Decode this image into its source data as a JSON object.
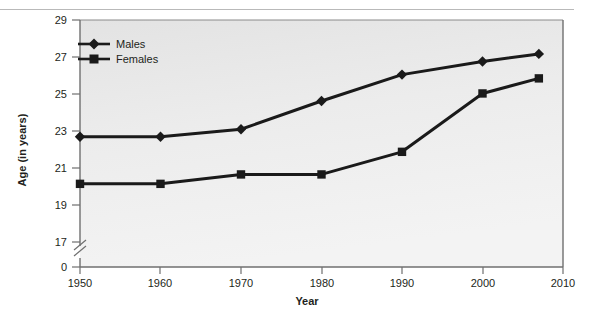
{
  "chart_data": {
    "type": "line",
    "title": "",
    "xlabel": "Year",
    "ylabel": "Age (in years)",
    "x": [
      1950,
      1960,
      1970,
      1980,
      1990,
      2000,
      2007
    ],
    "series": [
      {
        "name": "Males",
        "marker": "diamond",
        "color": "#1a1a1a",
        "values": [
          22.8,
          22.8,
          23.2,
          24.7,
          26.1,
          26.8,
          27.2
        ]
      },
      {
        "name": "Females",
        "marker": "square",
        "color": "#1a1a1a",
        "values": [
          20.3,
          20.3,
          20.8,
          20.8,
          22.0,
          25.1,
          25.9
        ]
      }
    ],
    "x_ticks": [
      "1950",
      "1960",
      "1970",
      "1980",
      "1990",
      "2000",
      "2010"
    ],
    "x_tick_values": [
      1950,
      1960,
      1970,
      1980,
      1990,
      2000,
      2010
    ],
    "xlim": [
      1950,
      2010
    ],
    "y_ticks": [
      "0",
      "17",
      "19",
      "21",
      "23",
      "25",
      "27",
      "29"
    ],
    "y_tick_values": [
      0,
      17,
      19,
      21,
      23,
      25,
      27,
      29
    ],
    "ylim": [
      17,
      29
    ],
    "y_axis_break": true,
    "y_axis_break_label": "axis-break-zigzag",
    "grid": false,
    "legend_position": "top-left",
    "plot_background": "#e9e9e9",
    "figure_background": "#ffffff",
    "axis_color": "#6f6f6f"
  },
  "axes": {
    "x_title": "Year",
    "y_title": "Age (in years)"
  },
  "legend": {
    "entries": [
      {
        "label": "Males",
        "marker": "diamond-marker"
      },
      {
        "label": "Females",
        "marker": "square-marker"
      }
    ]
  },
  "y_tick_labels": {
    "t0": "29",
    "t1": "27",
    "t2": "25",
    "t3": "23",
    "t4": "21",
    "t5": "19",
    "t6": "17",
    "t7": "0"
  },
  "x_tick_labels": {
    "t0": "1950",
    "t1": "1960",
    "t2": "1970",
    "t3": "1980",
    "t4": "1990",
    "t5": "2000",
    "t6": "2010"
  }
}
